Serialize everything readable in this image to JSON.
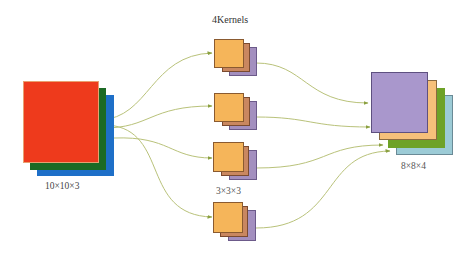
{
  "diagram": {
    "input": {
      "label": "10×10×3",
      "channels": [
        {
          "name": "red",
          "color": "#ee3a1c"
        },
        {
          "name": "green",
          "color": "#1c6a25"
        },
        {
          "name": "blue",
          "color": "#1e6fc8"
        }
      ]
    },
    "kernels": {
      "top_label": "4Kernels",
      "size_label": "3×3×3",
      "count": 4,
      "layer_colors": [
        "#f5b55a",
        "#c98760",
        "#a38fbf"
      ]
    },
    "output": {
      "label": "8×8×4",
      "channels": [
        {
          "name": "purple",
          "color": "#a997cc"
        },
        {
          "name": "orange",
          "color": "#f6c07a"
        },
        {
          "name": "green",
          "color": "#6ea227"
        },
        {
          "name": "light-blue",
          "color": "#9ccbd6"
        }
      ]
    },
    "connector_color": "#b9c27a"
  }
}
